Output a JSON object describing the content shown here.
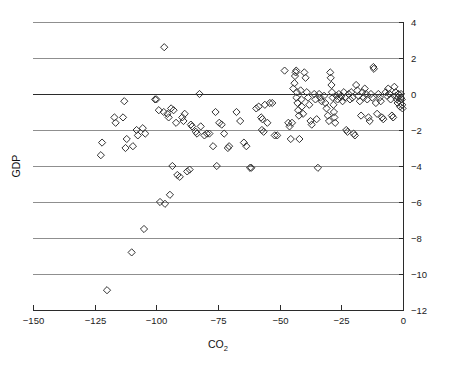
{
  "chart_data": {
    "type": "scatter",
    "title": "",
    "xlabel": "CO2",
    "xlabel_base": "CO",
    "xlabel_sub": "2",
    "ylabel": "GDP",
    "xlim": [
      -150,
      0
    ],
    "ylim": [
      -12,
      4
    ],
    "xticks": [
      -150,
      -125,
      -100,
      -75,
      -50,
      -25,
      0
    ],
    "xtick_labels": [
      "−150",
      "−125",
      "−100",
      "−75",
      "−50",
      "−25",
      "0"
    ],
    "yticks": [
      4,
      2,
      0,
      -2,
      -4,
      -6,
      -8,
      -10,
      -12
    ],
    "ytick_labels": [
      "4",
      "2",
      "0",
      "−2",
      "−4",
      "−6",
      "−8",
      "−10",
      "−12"
    ],
    "grid": "horizontal",
    "gridlines_at": [
      4,
      2,
      0,
      -2,
      -4,
      -6,
      -8,
      -10
    ],
    "legend": "none",
    "y_axis_side": "right",
    "marker": "open-diamond",
    "marker_color": "#333333",
    "marker_fill": "none",
    "series": [
      {
        "name": "countries",
        "points": [
          [
            -120.0,
            -10.9
          ],
          [
            -110.0,
            -8.8
          ],
          [
            -105.0,
            -7.5
          ],
          [
            -98.5,
            -6.0
          ],
          [
            -96.5,
            -6.1
          ],
          [
            -94.5,
            -5.6
          ],
          [
            -93.5,
            -4.0
          ],
          [
            -96.8,
            2.6
          ],
          [
            -122.0,
            -2.7
          ],
          [
            -122.5,
            -3.4
          ],
          [
            -117.0,
            -1.3
          ],
          [
            -116.5,
            -1.6
          ],
          [
            -113.5,
            -1.3
          ],
          [
            -113.0,
            -0.4
          ],
          [
            -112.0,
            -2.5
          ],
          [
            -112.5,
            -3.0
          ],
          [
            -109.5,
            -2.9
          ],
          [
            -108.0,
            -2.0
          ],
          [
            -107.5,
            -2.3
          ],
          [
            -105.5,
            -1.9
          ],
          [
            -104.5,
            -2.2
          ],
          [
            -100.5,
            -0.3
          ],
          [
            -100.0,
            -0.3
          ],
          [
            -99.0,
            -0.9
          ],
          [
            -97.0,
            -1.0
          ],
          [
            -95.5,
            -1.1
          ],
          [
            -95.0,
            -1.3
          ],
          [
            -94.0,
            -0.8
          ],
          [
            -93.0,
            -0.9
          ],
          [
            -92.0,
            -1.6
          ],
          [
            -91.5,
            -4.5
          ],
          [
            -90.5,
            -4.6
          ],
          [
            -89.5,
            -1.3
          ],
          [
            -89.0,
            -1.5
          ],
          [
            -88.5,
            -1.1
          ],
          [
            -87.5,
            -4.3
          ],
          [
            -86.5,
            -4.2
          ],
          [
            -86.0,
            -1.7
          ],
          [
            -85.5,
            -1.8
          ],
          [
            -84.0,
            -2.1
          ],
          [
            -83.5,
            -2.2
          ],
          [
            -82.5,
            0.0
          ],
          [
            -82.0,
            -1.8
          ],
          [
            -80.5,
            -2.3
          ],
          [
            -79.5,
            -2.2
          ],
          [
            -78.5,
            -2.2
          ],
          [
            -77.0,
            -2.9
          ],
          [
            -76.0,
            -1.0
          ],
          [
            -75.5,
            -4.0
          ],
          [
            -74.5,
            -1.6
          ],
          [
            -73.5,
            -1.7
          ],
          [
            -72.5,
            -2.2
          ],
          [
            -71.0,
            -3.0
          ],
          [
            -70.5,
            -2.9
          ],
          [
            -67.5,
            -1.0
          ],
          [
            -66.0,
            -1.5
          ],
          [
            -64.5,
            -2.7
          ],
          [
            -63.5,
            -2.9
          ],
          [
            -62.0,
            -4.1
          ],
          [
            -61.5,
            -4.1
          ],
          [
            -59.5,
            -0.8
          ],
          [
            -58.5,
            -0.7
          ],
          [
            -57.5,
            -1.3
          ],
          [
            -57.0,
            -1.4
          ],
          [
            -57.2,
            -2.0
          ],
          [
            -56.5,
            -2.1
          ],
          [
            -56.0,
            -0.6
          ],
          [
            -55.0,
            -1.6
          ],
          [
            -54.0,
            -0.5
          ],
          [
            -53.0,
            -0.5
          ],
          [
            -52.0,
            -2.3
          ],
          [
            -51.0,
            -2.3
          ],
          [
            -48.0,
            1.3
          ],
          [
            -46.5,
            -1.6
          ],
          [
            -46.0,
            -1.8
          ],
          [
            -45.5,
            -2.5
          ],
          [
            -45.0,
            -1.6
          ],
          [
            -44.5,
            0.3
          ],
          [
            -44.0,
            0.6
          ],
          [
            -43.8,
            1.0
          ],
          [
            -43.5,
            1.2
          ],
          [
            -43.3,
            1.3
          ],
          [
            -43.0,
            0.1
          ],
          [
            -43.2,
            -0.2
          ],
          [
            -42.8,
            -0.5
          ],
          [
            -42.5,
            -0.9
          ],
          [
            -42.2,
            -1.2
          ],
          [
            -42.0,
            -2.5
          ],
          [
            -41.5,
            0.2
          ],
          [
            -41.2,
            -0.3
          ],
          [
            -41.0,
            -0.7
          ],
          [
            -40.5,
            -1.1
          ],
          [
            -40.0,
            1.2
          ],
          [
            -39.5,
            0.9
          ],
          [
            -39.0,
            0.1
          ],
          [
            -38.5,
            -0.2
          ],
          [
            -38.0,
            -0.6
          ],
          [
            -37.5,
            -1.5
          ],
          [
            -37.0,
            -1.7
          ],
          [
            -36.0,
            0.0
          ],
          [
            -35.5,
            -0.3
          ],
          [
            -35.0,
            -1.4
          ],
          [
            -34.5,
            -4.1
          ],
          [
            -34.0,
            0.0
          ],
          [
            -33.5,
            -0.2
          ],
          [
            -33.0,
            -0.4
          ],
          [
            -32.0,
            -0.1
          ],
          [
            -31.5,
            -0.5
          ],
          [
            -31.0,
            -0.8
          ],
          [
            -30.5,
            -1.2
          ],
          [
            -30.0,
            -1.5
          ],
          [
            -29.5,
            1.2
          ],
          [
            -29.3,
            0.9
          ],
          [
            -29.0,
            0.5
          ],
          [
            -28.8,
            0.1
          ],
          [
            -28.5,
            -0.2
          ],
          [
            -28.2,
            -0.6
          ],
          [
            -28.0,
            -1.0
          ],
          [
            -27.8,
            -1.3
          ],
          [
            -27.5,
            -1.6
          ],
          [
            -27.0,
            -0.1
          ],
          [
            -26.5,
            -0.3
          ],
          [
            -26.0,
            0.0
          ],
          [
            -25.5,
            -0.2
          ],
          [
            -25.0,
            -0.1
          ],
          [
            -24.5,
            -0.4
          ],
          [
            -24.0,
            0.1
          ],
          [
            -23.5,
            -0.2
          ],
          [
            -23.0,
            -2.0
          ],
          [
            -22.5,
            -2.1
          ],
          [
            -22.0,
            0.0
          ],
          [
            -21.5,
            -0.3
          ],
          [
            -21.0,
            0.1
          ],
          [
            -20.5,
            -0.2
          ],
          [
            -20.0,
            -2.2
          ],
          [
            -19.5,
            -2.3
          ],
          [
            -19.0,
            0.5
          ],
          [
            -18.5,
            0.2
          ],
          [
            -18.0,
            -0.1
          ],
          [
            -17.5,
            -0.4
          ],
          [
            -17.0,
            -1.2
          ],
          [
            -16.5,
            0.1
          ],
          [
            -16.0,
            -0.2
          ],
          [
            -15.5,
            0.3
          ],
          [
            -15.0,
            0.0
          ],
          [
            -14.5,
            -0.3
          ],
          [
            -14.0,
            -1.3
          ],
          [
            -13.5,
            -1.5
          ],
          [
            -13.0,
            0.0
          ],
          [
            -12.5,
            -0.2
          ],
          [
            -12.0,
            1.5
          ],
          [
            -11.8,
            1.4
          ],
          [
            -11.0,
            -0.5
          ],
          [
            -10.5,
            -1.1
          ],
          [
            -10.0,
            0.0
          ],
          [
            -9.5,
            -0.2
          ],
          [
            -9.0,
            -0.4
          ],
          [
            -8.5,
            -1.3
          ],
          [
            -8.0,
            -1.4
          ],
          [
            -7.0,
            0.1
          ],
          [
            -6.5,
            -0.1
          ],
          [
            -6.0,
            0.3
          ],
          [
            -5.5,
            0.0
          ],
          [
            -5.0,
            -0.3
          ],
          [
            -4.5,
            -1.2
          ],
          [
            -4.0,
            -1.3
          ],
          [
            -3.5,
            0.4
          ],
          [
            -3.0,
            0.1
          ],
          [
            -2.8,
            -0.1
          ],
          [
            -2.5,
            -0.3
          ],
          [
            -2.2,
            -0.5
          ],
          [
            -2.0,
            -0.2
          ],
          [
            -1.8,
            0.0
          ],
          [
            -1.5,
            -0.4
          ],
          [
            -1.2,
            -0.7
          ],
          [
            -1.0,
            -0.2
          ],
          [
            -0.8,
            0.0
          ],
          [
            -0.5,
            -0.3
          ],
          [
            -0.3,
            -0.6
          ],
          [
            -0.2,
            -0.8
          ]
        ]
      }
    ]
  }
}
